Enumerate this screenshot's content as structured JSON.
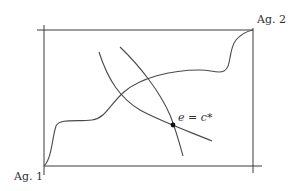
{
  "diagram": {
    "type": "edgeworth-box",
    "labels": {
      "agent1": "Ag. 1",
      "agent2": "Ag. 2",
      "equilibrium": "e = c*"
    },
    "elements": {
      "box": "rectangle with axes for two agents",
      "contract_curve": "wavy curve from Ag. 1 origin to Ag. 2 origin",
      "indifference_curve_1": "steep downward curve",
      "indifference_curve_2": "curve crossing through equilibrium",
      "equilibrium_point": "black dot labeled e = c*"
    },
    "colors": {
      "lines": "#3a3a3a",
      "dot": "#111111"
    }
  }
}
